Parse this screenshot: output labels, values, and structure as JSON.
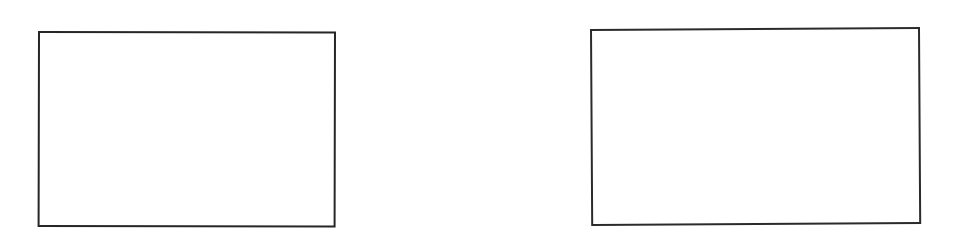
{
  "page": {
    "background_color": "#ffffff",
    "width": 958,
    "height": 238
  },
  "figure": {
    "kind": "two-empty-rectangular-frames",
    "stroke_color": "#262626",
    "fill_color": "#ffffff",
    "stroke_width_px": 2,
    "frames": [
      {
        "name": "left-frame",
        "label": "",
        "content": "",
        "x": 38,
        "y": 31,
        "width": 298,
        "height": 196,
        "stroke_color": "#262626",
        "fill_color": "#ffffff"
      },
      {
        "name": "right-frame",
        "label": "",
        "content": "",
        "x": 590,
        "y": 29,
        "width": 330,
        "height": 197,
        "stroke_color": "#2b2b2b",
        "fill_color": "#ffffff"
      }
    ]
  }
}
